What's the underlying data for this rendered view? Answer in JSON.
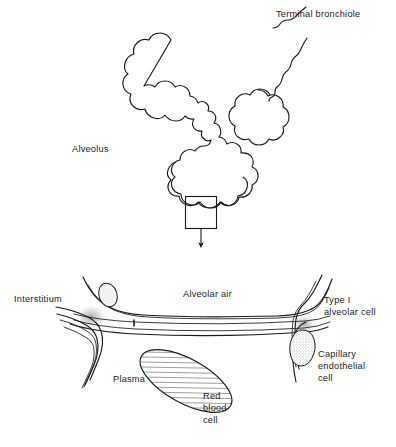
{
  "figure": {
    "background_color": "#ffffff",
    "ink_color": "#1a1a1a"
  },
  "upper_panel": {
    "name": "alveolar-cluster-panel",
    "labels": {
      "terminal_bronchiole": "Terminal bronchiole",
      "alveolus": "Alveolus"
    },
    "magnifier": {
      "name": "magnification-box",
      "description": "small square outlining region enlarged below",
      "arrow": "downward arrow to lower panel"
    }
  },
  "lower_panel": {
    "name": "alveolar-capillary-membrane-panel",
    "labels": {
      "interstitium": "Interstitium",
      "alveolar_air": "Alveolar air",
      "type_i_alveolar_cell_line1": "Type I",
      "type_i_alveolar_cell_line2": "alveolar cell",
      "capillary_endothelial_cell_line1": "Capillary",
      "capillary_endothelial_cell_line2": "endothelial",
      "capillary_endothelial_cell_line3": "cell",
      "plasma": "Plasma",
      "red_blood_cell_line1": "Red",
      "red_blood_cell_line2": "blood",
      "red_blood_cell_line3": "cell"
    },
    "structures": {
      "type_i_nucleus": "stippled oval nucleus of type I alveolar cell",
      "endothelial_nucleus": "stippled teardrop nucleus of capillary endothelial cell",
      "red_blood_cell": "hatched elliptical erythrocyte in plasma"
    }
  },
  "caption": {
    "text": ""
  }
}
